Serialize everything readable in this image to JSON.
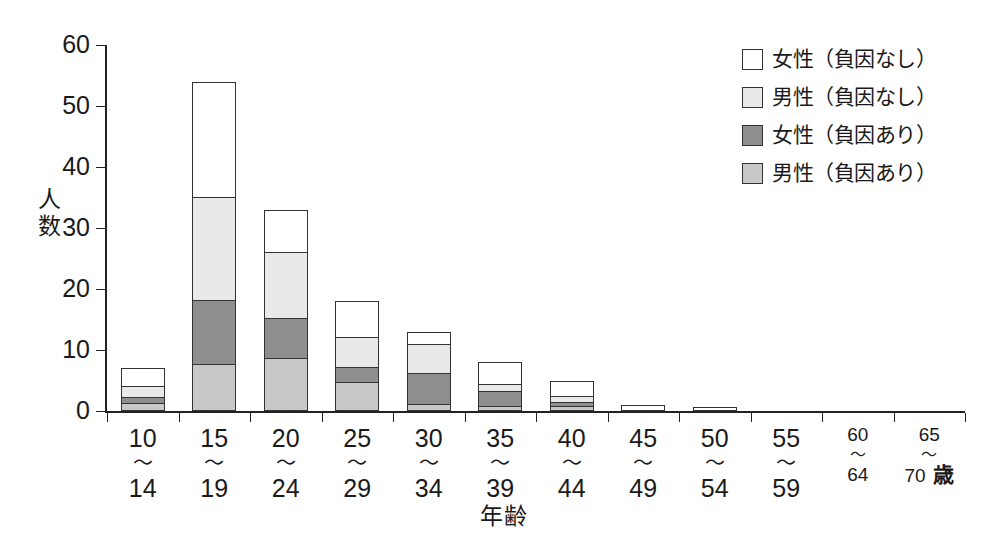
{
  "chart_data": {
    "type": "bar",
    "subtype": "stacked-vertical",
    "title": "",
    "xlabel": "年齢",
    "ylabel": "人数",
    "ylim": [
      0,
      60
    ],
    "yticks": [
      0,
      10,
      20,
      30,
      40,
      50,
      60
    ],
    "grid": false,
    "legend_position": "top-right",
    "categories": [
      "10\n〜\n14",
      "15\n〜\n19",
      "20\n〜\n24",
      "25\n〜\n29",
      "30\n〜\n34",
      "35\n〜\n39",
      "40\n〜\n44",
      "45\n〜\n49",
      "50\n〜\n54",
      "55\n〜\n59",
      "60\n〜\n64",
      "65\n〜\n70"
    ],
    "series": [
      {
        "name": "男性（負因あり）",
        "color": "#c8c8c8",
        "values": [
          1,
          7.5,
          8.5,
          4.5,
          0.8,
          0.5,
          0.5,
          0,
          0,
          0,
          0,
          0
        ]
      },
      {
        "name": "女性（負因あり）",
        "color": "#8e8e8e",
        "values": [
          1,
          10.5,
          6.5,
          2.5,
          5.2,
          2.5,
          0.8,
          0,
          0,
          0,
          0,
          0
        ]
      },
      {
        "name": "男性（負因なし）",
        "color": "#e9e9e9",
        "values": [
          2,
          17,
          11,
          5,
          5,
          1.2,
          1,
          0,
          0,
          0,
          0,
          0
        ]
      },
      {
        "name": "女性（負因なし）",
        "color": "#ffffff",
        "values": [
          3,
          19,
          7,
          6,
          2,
          3.8,
          2.7,
          1,
          0.6,
          0,
          0,
          0
        ]
      }
    ],
    "totals": [
      7,
      54,
      33,
      18,
      13,
      8,
      5,
      1,
      0.6,
      0,
      0,
      0
    ],
    "stack_order_bottom_to_top": [
      "男性（負因あり）",
      "女性（負因あり）",
      "男性（負因なし）",
      "女性（負因なし）"
    ]
  },
  "axes": {
    "y_title": "人数",
    "x_title": "年齢",
    "y_ticks": [
      "60",
      "50",
      "40",
      "30",
      "20",
      "10",
      "0"
    ]
  },
  "x_labels": [
    {
      "from": "10",
      "tilde": "〜",
      "to": "14",
      "unit": "",
      "small": false
    },
    {
      "from": "15",
      "tilde": "〜",
      "to": "19",
      "unit": "",
      "small": false
    },
    {
      "from": "20",
      "tilde": "〜",
      "to": "24",
      "unit": "",
      "small": false
    },
    {
      "from": "25",
      "tilde": "〜",
      "to": "29",
      "unit": "",
      "small": false
    },
    {
      "from": "30",
      "tilde": "〜",
      "to": "34",
      "unit": "",
      "small": false
    },
    {
      "from": "35",
      "tilde": "〜",
      "to": "39",
      "unit": "",
      "small": false
    },
    {
      "from": "40",
      "tilde": "〜",
      "to": "44",
      "unit": "",
      "small": false
    },
    {
      "from": "45",
      "tilde": "〜",
      "to": "49",
      "unit": "",
      "small": false
    },
    {
      "from": "50",
      "tilde": "〜",
      "to": "54",
      "unit": "",
      "small": false
    },
    {
      "from": "55",
      "tilde": "〜",
      "to": "59",
      "unit": "",
      "small": false
    },
    {
      "from": "60",
      "tilde": "〜",
      "to": "64",
      "unit": "",
      "small": true
    },
    {
      "from": "65",
      "tilde": "〜",
      "to": "70",
      "unit": "歳",
      "small": true
    }
  ],
  "legend": {
    "items": [
      {
        "label": "女性（負因なし）",
        "color": "#ffffff"
      },
      {
        "label": "男性（負因なし）",
        "color": "#e9e9e9"
      },
      {
        "label": "女性（負因あり）",
        "color": "#8e8e8e"
      },
      {
        "label": "男性（負因あり）",
        "color": "#c8c8c8"
      }
    ]
  }
}
